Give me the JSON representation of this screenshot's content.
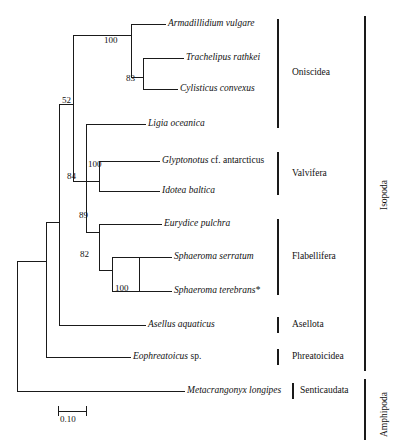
{
  "figure": {
    "type": "phylogenetic-tree",
    "orientation": "rectangular-cladogram-left-to-right"
  },
  "taxa": [
    {
      "id": "armadillidium",
      "name": "Armadillidium vulgare",
      "suffix": "",
      "y": 24
    },
    {
      "id": "trachelipus",
      "name": "Trachelipus rathkei",
      "suffix": "",
      "y": 58
    },
    {
      "id": "cylisticus",
      "name": "Cylisticus convexus",
      "suffix": "",
      "y": 89
    },
    {
      "id": "ligia",
      "name": "Ligia oceanica",
      "suffix": "",
      "y": 124
    },
    {
      "id": "glyptonotus",
      "name": "Glyptonotus",
      "suffix": " cf. antarcticus",
      "y": 161
    },
    {
      "id": "idotea",
      "name": "Idotea baltica",
      "suffix": "",
      "y": 191
    },
    {
      "id": "eurydice",
      "name": "Eurydice pulchra",
      "suffix": "",
      "y": 224
    },
    {
      "id": "sphaeroma-serratum",
      "name": "Sphaeroma serratum",
      "suffix": "",
      "y": 257
    },
    {
      "id": "sphaeroma-terebrans",
      "name": "Sphaeroma terebrans*",
      "suffix": "",
      "y": 291
    },
    {
      "id": "asellus",
      "name": "Asellus aquaticus",
      "suffix": "",
      "y": 325
    },
    {
      "id": "eophreatoicus",
      "name": "Eophreatoicus",
      "suffix": " sp.",
      "y": 357
    },
    {
      "id": "metacrangonyx",
      "name": "Metacrangonyx longipes",
      "suffix": "",
      "y": 391
    }
  ],
  "bootstrap_values": [
    {
      "id": "node-oniscidea-crown",
      "value": "100",
      "x": 104,
      "y": 41
    },
    {
      "id": "node-trachelipus-cylisticus",
      "value": "83",
      "x": 126,
      "y": 79
    },
    {
      "id": "node-isopoda-basal",
      "value": "52",
      "x": 68,
      "y": 101
    },
    {
      "id": "node-valvifera",
      "value": "100",
      "x": 93,
      "y": 165
    },
    {
      "id": "node-84",
      "value": "84",
      "x": 72,
      "y": 177
    },
    {
      "id": "node-89",
      "value": "89",
      "x": 84,
      "y": 215
    },
    {
      "id": "node-82",
      "value": "82",
      "x": 85,
      "y": 254
    },
    {
      "id": "node-sphaeroma",
      "value": "100",
      "x": 120,
      "y": 288
    }
  ],
  "clade_brackets": [
    {
      "id": "oniscidea",
      "label": "Oniscidea",
      "y_top": 19,
      "y_bottom": 128,
      "bracket_x": 278,
      "label_x": 292
    },
    {
      "id": "valvifera",
      "label": "Valvifera",
      "y_top": 152,
      "y_bottom": 195,
      "bracket_x": 278,
      "label_x": 292
    },
    {
      "id": "flabellifera",
      "label": "Flabellifera",
      "y_top": 219,
      "y_bottom": 295,
      "bracket_x": 278,
      "label_x": 292
    },
    {
      "id": "asellota",
      "label": "Asellota",
      "y_top": 317,
      "y_bottom": 333,
      "bracket_x": 278,
      "label_x": 292
    },
    {
      "id": "phreatoicidea",
      "label": "Phreatoicidea",
      "y_top": 349,
      "y_bottom": 365,
      "bracket_x": 278,
      "label_x": 292
    },
    {
      "id": "senticaudata",
      "label": "Senticaudata",
      "y_top": 383,
      "y_bottom": 399,
      "bracket_x": 293,
      "label_x": 300
    }
  ],
  "superclade_brackets": [
    {
      "id": "isopoda",
      "label": "Isopoda",
      "y_top": 16,
      "y_bottom": 371,
      "bracket_x": 365,
      "label_x": 380,
      "label_y": 210
    },
    {
      "id": "amphipoda",
      "label": "Amphipoda",
      "y_top": 379,
      "y_bottom": 440,
      "bracket_x": 365,
      "label_x": 380,
      "label_y": 433
    }
  ],
  "scale_bar": {
    "label": "0.10",
    "x_start": 58,
    "x_end": 86,
    "y": 411,
    "label_x": 59,
    "label_y": 417
  },
  "colors": {
    "line": "#1a1a1a",
    "bracket": "#1a1a1a",
    "background": "#ffffff",
    "text": "#111111"
  }
}
